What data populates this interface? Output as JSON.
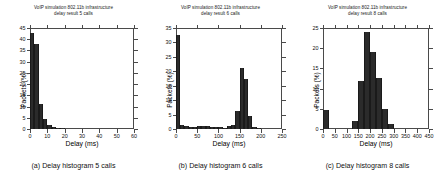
{
  "figure": {
    "panels": [
      {
        "key": "a",
        "title_line1": "VoIP simulation 802.11b infrastructure",
        "title_line2": "delay result 5 calls",
        "caption": "(a) Delay histogram 5 calls",
        "xlabel": "Delay (ms)",
        "ylabel": "Packets (%)"
      },
      {
        "key": "b",
        "title_line1": "VoIP simulation 802.11b infrastructure",
        "title_line2": "delay result 6 calls",
        "caption": "(b) Delay histogram 6 calls",
        "xlabel": "Delay (ms)",
        "ylabel": "Packets (%)"
      },
      {
        "key": "c",
        "title_line1": "VoIP simulation 802.11b infrastructure",
        "title_line2": "delay result 8 calls",
        "caption": "(c) Delay histogram 8 calls",
        "xlabel": "Delay (ms)",
        "ylabel": "Packets (%)"
      }
    ]
  },
  "chart_data": [
    {
      "type": "bar",
      "panel": "a",
      "title": "VoIP simulation 802.11b infrastructure delay result 5 calls",
      "xlabel": "Delay (ms)",
      "ylabel": "Packets (%)",
      "xlim": [
        0,
        60
      ],
      "ylim": [
        0,
        45
      ],
      "xticks": [
        0,
        10,
        20,
        30,
        40,
        50,
        60
      ],
      "yticks": [
        0,
        5,
        10,
        15,
        20,
        25,
        30,
        35,
        40,
        45
      ],
      "grid": false,
      "legend": "none",
      "bin_width": 2.5,
      "bin_left_edges": [
        0,
        2.5,
        5,
        7.5,
        10,
        12.5,
        15,
        17.5
      ],
      "values": [
        43,
        38,
        11,
        4.5,
        1.6,
        1.0,
        0.6,
        0.3
      ],
      "bar_color": "#2b2b2b"
    },
    {
      "type": "bar",
      "panel": "b",
      "title": "VoIP simulation 802.11b infrastructure delay result 6 calls",
      "xlabel": "Delay (ms)",
      "ylabel": "Packets (%)",
      "xlim": [
        0,
        250
      ],
      "ylim": [
        0,
        35
      ],
      "xticks": [
        0,
        50,
        100,
        150,
        200,
        250
      ],
      "yticks": [
        0,
        5,
        10,
        15,
        20,
        25,
        30,
        35
      ],
      "grid": false,
      "legend": "none",
      "bin_width": 10,
      "bin_left_edges": [
        0,
        10,
        20,
        30,
        40,
        50,
        60,
        70,
        80,
        90,
        100,
        110,
        120,
        130,
        140,
        150,
        160,
        170,
        180,
        190
      ],
      "values": [
        32.5,
        1.5,
        1.0,
        0.8,
        0.8,
        0.9,
        0.9,
        0.9,
        0.8,
        0.8,
        0.6,
        0.5,
        0.9,
        1.3,
        6.3,
        21,
        17.3,
        4.5,
        0.8,
        0.3
      ],
      "bar_color": "#2b2b2b"
    },
    {
      "type": "bar",
      "panel": "c",
      "title": "VoIP simulation 802.11b infrastructure delay result 8 calls",
      "xlabel": "Delay (ms)",
      "ylabel": "Packets (%)",
      "xlim": [
        0,
        450
      ],
      "ylim": [
        0,
        25
      ],
      "xticks": [
        0,
        50,
        100,
        150,
        200,
        250,
        300,
        350,
        400,
        450
      ],
      "yticks": [
        0,
        5,
        10,
        15,
        20,
        25
      ],
      "grid": false,
      "legend": "none",
      "bin_width": 25,
      "bin_left_edges": [
        0,
        125,
        150,
        175,
        200,
        225,
        250,
        275
      ],
      "values": [
        4.6,
        2.0,
        12.0,
        24.0,
        19.0,
        12.6,
        5.0,
        1.3
      ],
      "bar_color": "#2b2b2b"
    }
  ]
}
